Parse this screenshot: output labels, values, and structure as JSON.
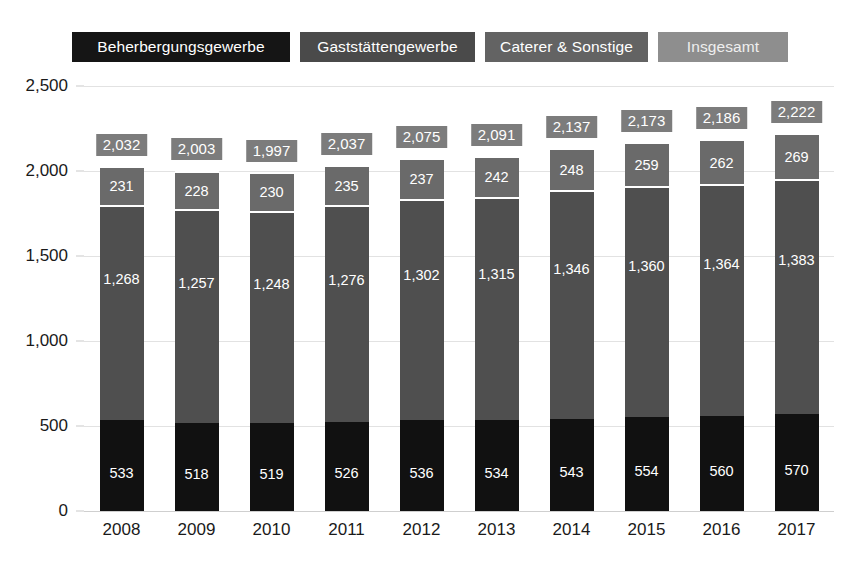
{
  "legend": {
    "items": [
      {
        "label": "Beherbergungsgewerbe",
        "color": "#151515"
      },
      {
        "label": "Gaststättengewerbe",
        "color": "#4a4a4a"
      },
      {
        "label": "Caterer & Sonstige",
        "color": "#636363"
      },
      {
        "label": "Insgesamt",
        "color": "#8e8e8e"
      }
    ]
  },
  "chart_data": {
    "type": "bar",
    "stacked": true,
    "title": "",
    "xlabel": "",
    "ylabel": "",
    "ylim": [
      0,
      2500
    ],
    "ytick_labels": [
      "0",
      "500",
      "1,000",
      "1,500",
      "2,000",
      "2,500"
    ],
    "ytick_values": [
      0,
      500,
      1000,
      1500,
      2000,
      2500
    ],
    "grid": true,
    "legend_position": "top",
    "categories": [
      "2008",
      "2009",
      "2010",
      "2011",
      "2012",
      "2013",
      "2014",
      "2015",
      "2016",
      "2017"
    ],
    "series": [
      {
        "name": "Beherbergungsgewerbe",
        "color": "#111111",
        "values": [
          533,
          518,
          519,
          526,
          536,
          534,
          543,
          554,
          560,
          570
        ],
        "labels": [
          "533",
          "518",
          "519",
          "526",
          "536",
          "534",
          "543",
          "554",
          "560",
          "570"
        ]
      },
      {
        "name": "Gaststättengewerbe",
        "color": "#4f4f4f",
        "values": [
          1268,
          1257,
          1248,
          1276,
          1302,
          1315,
          1346,
          1360,
          1364,
          1383
        ],
        "labels": [
          "1,268",
          "1,257",
          "1,248",
          "1,276",
          "1,302",
          "1,315",
          "1,346",
          "1,360",
          "1,364",
          "1,383"
        ]
      },
      {
        "name": "Caterer & Sonstige",
        "color": "#6a6a6a",
        "values": [
          231,
          228,
          230,
          235,
          237,
          242,
          248,
          259,
          262,
          269
        ],
        "labels": [
          "231",
          "228",
          "230",
          "235",
          "237",
          "242",
          "248",
          "259",
          "262",
          "269"
        ]
      }
    ],
    "totals": {
      "name": "Insgesamt",
      "color": "#7c7c7c",
      "values": [
        2032,
        2003,
        1997,
        2037,
        2075,
        2091,
        2137,
        2173,
        2186,
        2222
      ],
      "labels": [
        "2,032",
        "2,003",
        "1,997",
        "2,037",
        "2,075",
        "2,091",
        "2,137",
        "2,173",
        "2,186",
        "2,222"
      ]
    }
  }
}
